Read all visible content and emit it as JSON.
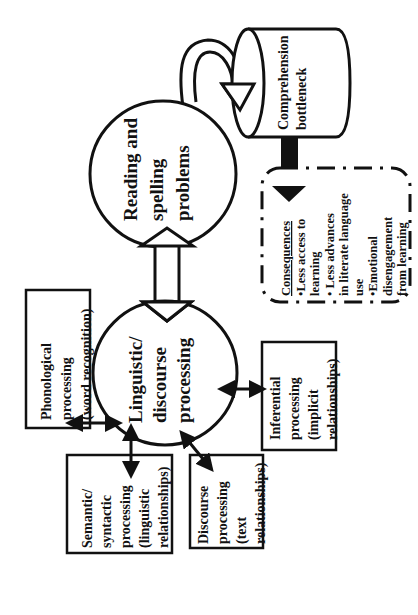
{
  "diagram": {
    "orientation": "rotated-90-ccw",
    "nodes": {
      "reading": {
        "lines": [
          "Reading and",
          "spelling",
          "problems"
        ]
      },
      "linguistic": {
        "lines": [
          "Linguistic/",
          "discourse",
          "processing"
        ]
      },
      "bottleneck": {
        "lines": [
          "Comprehension",
          "bottleneck"
        ]
      },
      "phonological": {
        "lines": [
          "Phonological",
          "processing",
          "(word recognition)"
        ]
      },
      "semantic": {
        "lines": [
          "Semantic/",
          "syntactic",
          "processing",
          "(linguistic",
          "relationships)"
        ]
      },
      "discourse": {
        "lines": [
          "Discourse",
          "processing",
          "(text",
          "relationships)"
        ]
      },
      "inferential": {
        "lines": [
          "Inferential",
          "processing",
          "(implicit",
          "relationships)"
        ]
      },
      "consequences": {
        "title": "Consequences",
        "lines": [
          "•Less access to",
          "learning",
          "• Less advances",
          "in literate language",
          "use",
          "•Emotional",
          "disengagement",
          "from learning"
        ]
      }
    },
    "colors": {
      "stroke": "#111111",
      "background": "#ffffff"
    }
  }
}
